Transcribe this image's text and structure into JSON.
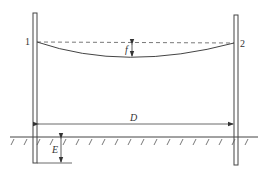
{
  "diagram": {
    "type": "overhead line sag between two poles",
    "point_labels": {
      "left": "1",
      "right": "2"
    },
    "sag_label": "f",
    "span_label": "D",
    "embed_label": "E",
    "colors": {
      "line": "#444444",
      "background": "#ffffff"
    }
  }
}
